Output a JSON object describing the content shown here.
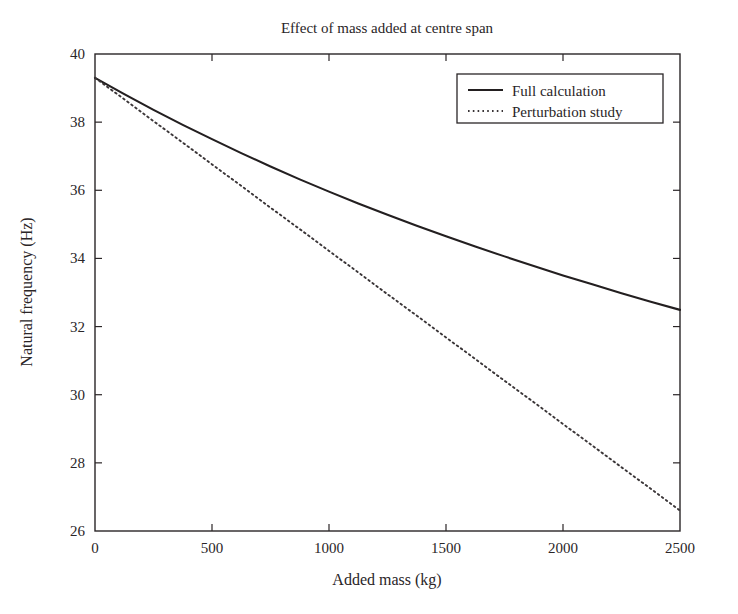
{
  "figure": {
    "background": "#ffffff",
    "ink_color": "#231f20"
  },
  "chart_data": {
    "type": "line",
    "title": "Effect of mass added at centre span",
    "xlabel": "Added mass (kg)",
    "ylabel": "Natural frequency (Hz)",
    "xlim": [
      0,
      2500
    ],
    "ylim": [
      26,
      40
    ],
    "xticks": [
      0,
      500,
      1000,
      1500,
      2000,
      2500
    ],
    "yticks": [
      26,
      28,
      30,
      32,
      34,
      36,
      38,
      40
    ],
    "xtick_labels": [
      "0",
      "500",
      "1000",
      "1500",
      "2000",
      "2500"
    ],
    "ytick_labels": [
      "26",
      "28",
      "30",
      "32",
      "34",
      "36",
      "38",
      "40"
    ],
    "grid": false,
    "legend_position": "upper right",
    "series": [
      {
        "name": "Full calculation",
        "style": "solid",
        "color": "#231f20",
        "x": [
          0,
          125,
          250,
          375,
          500,
          625,
          750,
          875,
          1000,
          1125,
          1250,
          1375,
          1500,
          1625,
          1750,
          1875,
          2000,
          2125,
          2250,
          2375,
          2500
        ],
        "values": [
          39.3,
          38.82,
          38.36,
          37.92,
          37.5,
          37.09,
          36.7,
          36.32,
          35.96,
          35.61,
          35.28,
          34.96,
          34.65,
          34.35,
          34.06,
          33.78,
          33.5,
          33.24,
          32.98,
          32.73,
          32.49
        ]
      },
      {
        "name": "Perturbation study",
        "style": "dotted",
        "color": "#3a3537",
        "x": [
          0,
          125,
          250,
          375,
          500,
          625,
          750,
          875,
          1000,
          1125,
          1250,
          1375,
          1500,
          1625,
          1750,
          1875,
          2000,
          2125,
          2250,
          2375,
          2500
        ],
        "values": [
          39.3,
          38.67,
          38.03,
          37.4,
          36.76,
          36.13,
          35.49,
          34.86,
          34.22,
          33.59,
          32.95,
          32.32,
          31.68,
          31.05,
          30.41,
          29.78,
          29.14,
          28.51,
          27.87,
          27.24,
          26.6
        ]
      }
    ]
  },
  "legend": {
    "entries": [
      {
        "label": "Full calculation",
        "style": "solid"
      },
      {
        "label": "Perturbation study",
        "style": "dotted"
      }
    ]
  }
}
